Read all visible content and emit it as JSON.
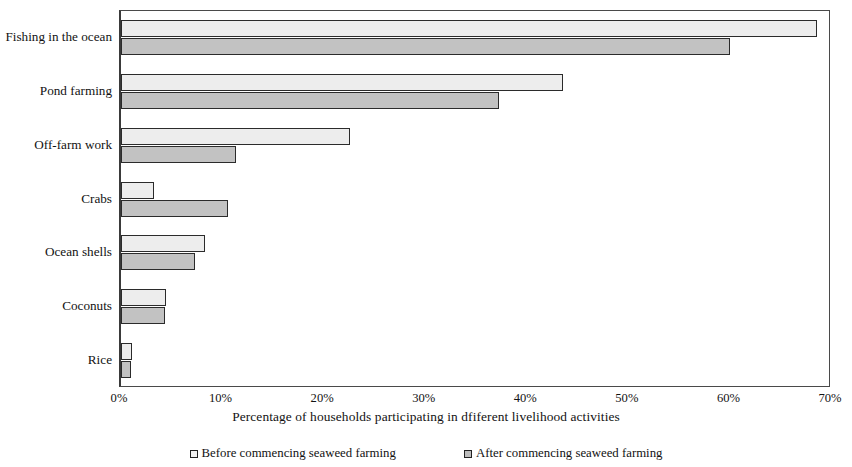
{
  "chart_data": {
    "type": "bar",
    "orientation": "horizontal",
    "title": "",
    "xlabel": "Percentage of households participating in dfiferent livelihood activities",
    "ylabel": "",
    "xlim": [
      0,
      70
    ],
    "xticks": [
      "0%",
      "10%",
      "20%",
      "30%",
      "40%",
      "50%",
      "60%",
      "70%"
    ],
    "xtick_values": [
      0,
      10,
      20,
      30,
      40,
      50,
      60,
      70
    ],
    "grid": false,
    "legend_position": "bottom",
    "categories": [
      "Fishing in the ocean",
      "Pond farming",
      "Off-farm work",
      "Crabs",
      "Ocean shells",
      "Coconuts",
      "Rice"
    ],
    "series": [
      {
        "name": "Before commencing seaweed farming",
        "color": "#ededed",
        "values": [
          68.5,
          43.5,
          22.5,
          3.2,
          8.3,
          4.4,
          1.1
        ]
      },
      {
        "name": "After commencing seaweed farming",
        "color": "#c2c2c2",
        "values": [
          60.0,
          37.2,
          11.3,
          10.5,
          7.3,
          4.3,
          1.0
        ]
      }
    ]
  },
  "legend": {
    "entries": [
      {
        "label": "Before commencing seaweed farming"
      },
      {
        "label": "After commencing seaweed farming"
      }
    ]
  }
}
